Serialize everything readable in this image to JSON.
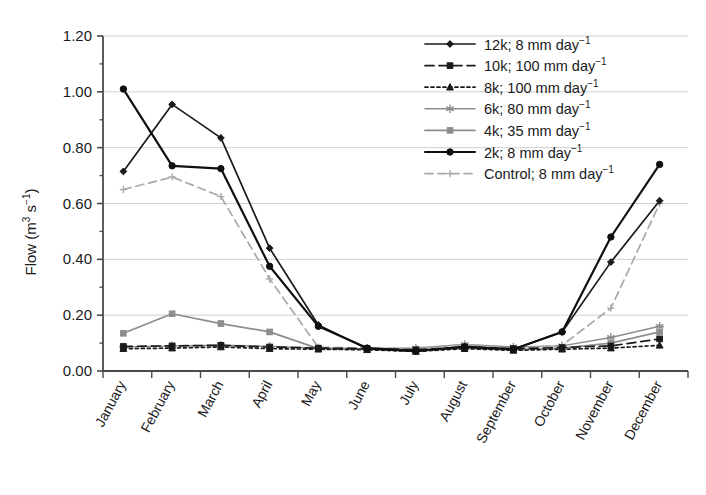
{
  "chart_data": {
    "type": "line",
    "title": "",
    "xlabel": "",
    "ylabel": "Flow (m3 s-1)",
    "ylabel_parts": {
      "base": "Flow (m",
      "sup1": "3",
      "mid": " s",
      "sup2": "−1",
      "tail": ")"
    },
    "ylim": [
      0.0,
      1.2
    ],
    "ytick_step": 0.2,
    "yticks": [
      "0.00",
      "0.20",
      "0.40",
      "0.60",
      "0.80",
      "1.00",
      "1.20"
    ],
    "ytick_values": [
      0.0,
      0.2,
      0.4,
      0.6,
      0.8,
      1.0,
      1.2
    ],
    "grid": true,
    "grid_axis": "y",
    "legend_position": "top-right",
    "categories": [
      "January",
      "February",
      "March",
      "April",
      "May",
      "June",
      "July",
      "August",
      "September",
      "October",
      "November",
      "December"
    ],
    "series": [
      {
        "name": "12k; 8 mm day-1",
        "label_base": "12k; 8 mm day",
        "label_sup": "−1",
        "color": "#1a1a1a",
        "dash": "none",
        "marker": "diamond",
        "width": 1.7,
        "values": [
          0.715,
          0.955,
          0.835,
          0.44,
          0.165,
          0.08,
          0.07,
          0.088,
          0.078,
          0.14,
          0.39,
          0.61
        ]
      },
      {
        "name": "10k; 100 mm day-1",
        "label_base": "10k; 100 mm day",
        "label_sup": "−1",
        "color": "#1a1a1a",
        "dash": "9,5",
        "marker": "square",
        "width": 1.7,
        "values": [
          0.088,
          0.09,
          0.092,
          0.086,
          0.082,
          0.08,
          0.076,
          0.086,
          0.08,
          0.084,
          0.09,
          0.115
        ]
      },
      {
        "name": "8k; 100 mm day-1",
        "label_base": "8k; 100 mm day",
        "label_sup": "−1",
        "color": "#1a1a1a",
        "dash": "3,3",
        "marker": "triangle",
        "width": 1.7,
        "values": [
          0.08,
          0.082,
          0.086,
          0.08,
          0.078,
          0.076,
          0.07,
          0.08,
          0.074,
          0.078,
          0.082,
          0.092
        ]
      },
      {
        "name": "6k; 80 mm day-1",
        "label_base": "6k; 80 mm day",
        "label_sup": "−1",
        "color": "#8d8d8d",
        "dash": "none",
        "marker": "star",
        "width": 1.5,
        "values": [
          0.086,
          0.09,
          0.092,
          0.088,
          0.082,
          0.08,
          0.082,
          0.095,
          0.086,
          0.09,
          0.12,
          0.16
        ]
      },
      {
        "name": "4k; 35 mm day-1",
        "label_base": "4k; 35 mm day",
        "label_sup": "−1",
        "color": "#8d8d8d",
        "dash": "none",
        "marker": "square",
        "width": 1.7,
        "values": [
          0.135,
          0.205,
          0.17,
          0.14,
          0.08,
          0.078,
          0.074,
          0.082,
          0.076,
          0.082,
          0.1,
          0.14
        ]
      },
      {
        "name": "2k; 8 mm day-1",
        "label_base": "2k; 8 mm day",
        "label_sup": "−1",
        "color": "#101010",
        "dash": "none",
        "marker": "circle",
        "width": 2.2,
        "values": [
          1.01,
          0.735,
          0.725,
          0.375,
          0.16,
          0.082,
          0.072,
          0.086,
          0.078,
          0.14,
          0.48,
          0.74
        ]
      },
      {
        "name": "Control; 8 mm day-1",
        "label_base": "Control; 8 mm day",
        "label_sup": "−1",
        "color": "#a8a8a8",
        "dash": "8,5",
        "marker": "plus",
        "width": 1.7,
        "values": [
          0.65,
          0.695,
          0.625,
          0.33,
          0.085,
          0.082,
          0.08,
          0.095,
          0.082,
          0.092,
          0.225,
          0.6
        ]
      }
    ]
  },
  "legend": {
    "entries": [
      "12k; 8 mm day",
      "10k; 100 mm day",
      "8k; 100 mm day",
      "6k; 80 mm day",
      "4k; 35 mm day",
      "2k; 8 mm day",
      "Control; 8 mm day"
    ],
    "superscript": "−1"
  },
  "colors": {
    "axis": "#4a4a4a",
    "grid": "#d0d0d0",
    "text": "#1a1a1a",
    "black_series": "#1a1a1a",
    "grey_series": "#8d8d8d",
    "light_grey_series": "#a8a8a8"
  }
}
